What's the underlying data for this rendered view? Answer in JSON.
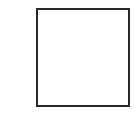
{
  "diagram": {
    "shape": "square",
    "stroke_color": "#2a2a2a",
    "fill_color": "#ffffff"
  }
}
